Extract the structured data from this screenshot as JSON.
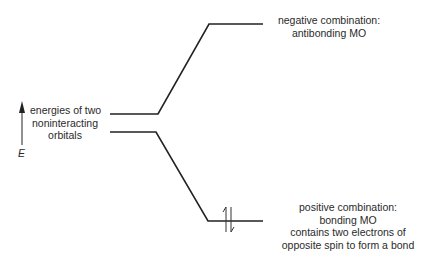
{
  "diagram": {
    "axis": {
      "label": "E"
    },
    "labels": {
      "noninteracting": [
        "energies of two",
        "noninteracting",
        "orbitals"
      ],
      "antibonding": [
        "negative combination:",
        "antibonding MO"
      ],
      "bonding": [
        "positive combination:",
        "bonding MO",
        "contains two electrons of",
        "opposite spin to form a bond"
      ]
    },
    "electrons": "↑↓"
  }
}
